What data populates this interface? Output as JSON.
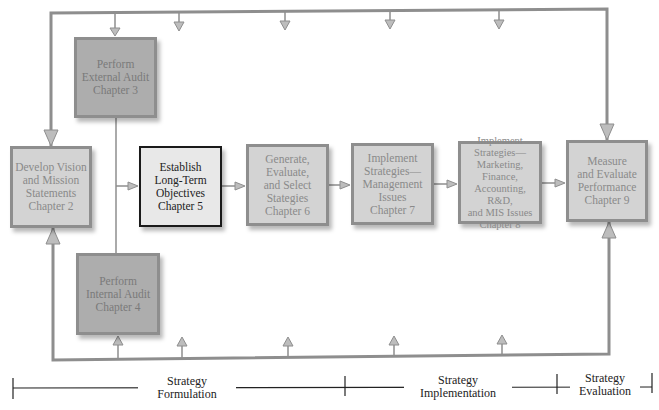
{
  "diagram": {
    "colors": {
      "line": "#8e8e8e",
      "arrow_fill": "#bdbdbd",
      "box_light": "#d3d3d3",
      "box_dark": "#adadad",
      "box_focus": "#e8e8e8",
      "focus_border": "#1a1a1a",
      "timeline": "#222222"
    },
    "boxes": [
      {
        "id": "vision",
        "label": "Develop Vision\nand Mission\nStatements\nChapter 2"
      },
      {
        "id": "external",
        "label": "Perform\nExternal Audit\nChapter 3"
      },
      {
        "id": "internal",
        "label": "Perform\nInternal Audit\nChapter 4"
      },
      {
        "id": "objectives",
        "label": "Establish\nLong-Term\nObjectives\nChapter 5"
      },
      {
        "id": "generate",
        "label": "Generate,\nEvaluate,\nand Select\nStategies\nChapter 6"
      },
      {
        "id": "implement_mgmt",
        "label": "Implement\nStrategies—\nManagement\nIssues\nChapter 7"
      },
      {
        "id": "implement_mkt",
        "label": "Implement\nStrategies—\nMarketing,\nFinance,\nAccounting, R&D,\nand MIS Issues\nChapter 8"
      },
      {
        "id": "measure",
        "label": "Measure\nand Evaluate\nPerformance\nChapter 9"
      }
    ],
    "phases": [
      {
        "label": "Strategy\nFormulation"
      },
      {
        "label": "Strategy\nImplementation"
      },
      {
        "label": "Strategy\nEvaluation"
      }
    ]
  }
}
